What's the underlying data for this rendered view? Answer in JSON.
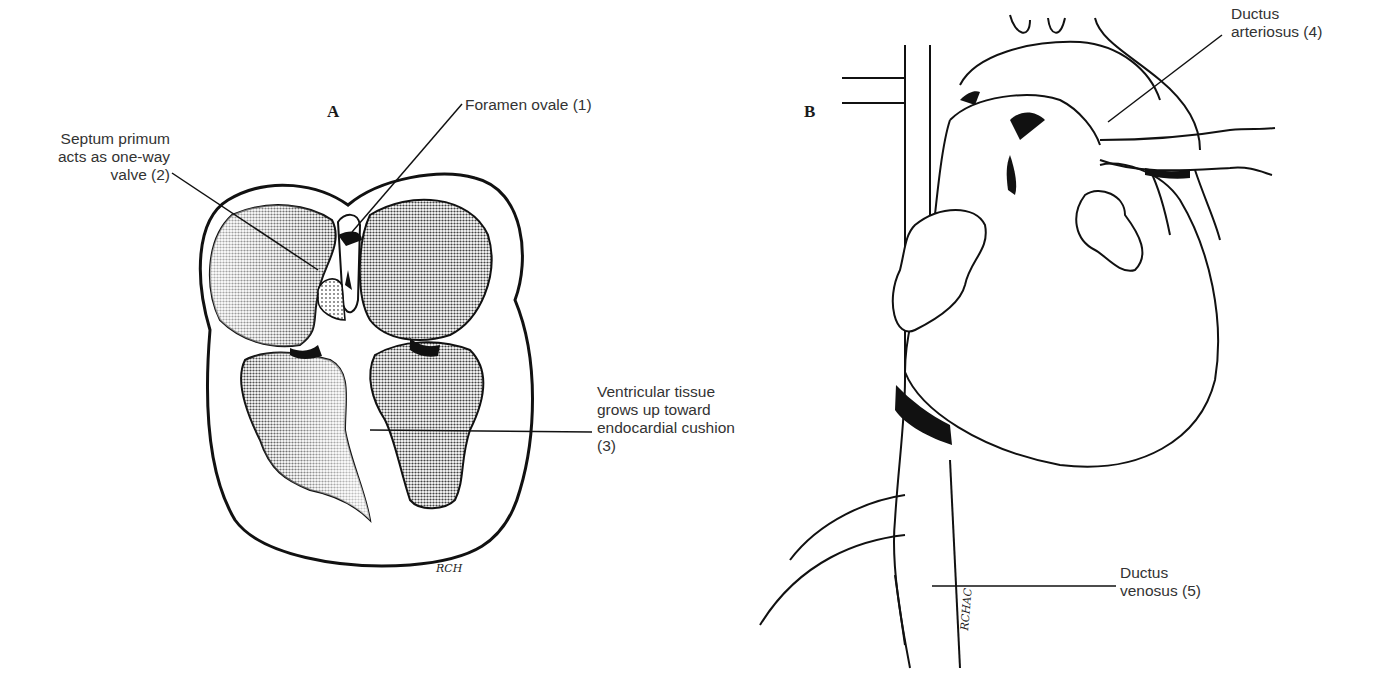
{
  "figure": {
    "panels": [
      {
        "id": "A",
        "letter": "A",
        "description": "Four-chamber cross-section of fetal heart",
        "labels": {
          "foramen_ovale": "Foramen ovale (1)",
          "septum_primum": "Septum primum\nacts as one-way\nvalve (2)",
          "ventricular_tissue": "Ventricular tissue\ngrows up toward\nendocardial cushion\n(3)"
        },
        "signature": "RCH"
      },
      {
        "id": "B",
        "letter": "B",
        "description": "External view of fetal heart and great vessels",
        "labels": {
          "ductus_arteriosus": "Ductus\narteriosus (4)",
          "ductus_venosus": "Ductus\nvenosus (5)"
        },
        "signature": "RCHAC"
      }
    ],
    "colors": {
      "ink": "#111111",
      "text": "#333333",
      "stipple_dark": "#7a7a7a",
      "stipple_light": "#c8c8c8",
      "background": "#ffffff"
    }
  }
}
